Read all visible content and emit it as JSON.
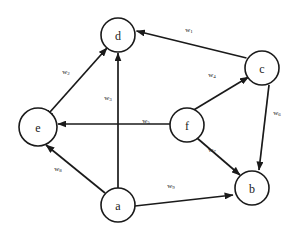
{
  "diagram": {
    "type": "directed-weighted-graph",
    "title": "",
    "background_color": "#ffffff",
    "stroke_color": "#1a1a1a",
    "node_fill_color": "#ffffff",
    "nodes": [
      {
        "id": "d",
        "label": "d",
        "cx": 118,
        "cy": 35,
        "r": 17
      },
      {
        "id": "c",
        "label": "c",
        "cx": 262,
        "cy": 68,
        "r": 17
      },
      {
        "id": "e",
        "label": "e",
        "cx": 38,
        "cy": 127,
        "r": 19
      },
      {
        "id": "f",
        "label": "f",
        "cx": 187,
        "cy": 125,
        "r": 17
      },
      {
        "id": "a",
        "label": "a",
        "cx": 118,
        "cy": 205,
        "r": 17
      },
      {
        "id": "b",
        "label": "b",
        "cx": 252,
        "cy": 188,
        "r": 17
      }
    ],
    "edges": [
      {
        "id": "c-d",
        "from": "c",
        "to": "d",
        "weight": "w",
        "subscript": "1",
        "label_x": 189,
        "label_y": 30,
        "directed": true
      },
      {
        "id": "e-d",
        "from": "e",
        "to": "d",
        "weight": "w",
        "subscript": "2",
        "label_x": 66,
        "label_y": 72,
        "directed": true,
        "bidirectional": true
      },
      {
        "id": "a-d",
        "from": "a",
        "to": "d",
        "weight": "w",
        "subscript": "3",
        "label_x": 108,
        "label_y": 98,
        "directed": true
      },
      {
        "id": "f-c",
        "from": "f",
        "to": "c",
        "weight": "w",
        "subscript": "4",
        "label_x": 212,
        "label_y": 75,
        "directed": true
      },
      {
        "id": "f-e",
        "from": "f",
        "to": "e",
        "weight": "w",
        "subscript": "5",
        "label_x": 146,
        "label_y": 121,
        "directed": true
      },
      {
        "id": "c-b",
        "from": "c",
        "to": "b",
        "weight": "w",
        "subscript": "6",
        "label_x": 277,
        "label_y": 113,
        "directed": true
      },
      {
        "id": "f-b",
        "from": "f",
        "to": "b",
        "weight": "w",
        "subscript": "7",
        "label_x": 212,
        "label_y": 150,
        "directed": true
      },
      {
        "id": "a-e",
        "from": "a",
        "to": "e",
        "weight": "w",
        "subscript": "8",
        "label_x": 58,
        "label_y": 169,
        "directed": true
      },
      {
        "id": "a-b",
        "from": "a",
        "to": "b",
        "weight": "w",
        "subscript": "9",
        "label_x": 171,
        "label_y": 186,
        "directed": true
      }
    ]
  }
}
